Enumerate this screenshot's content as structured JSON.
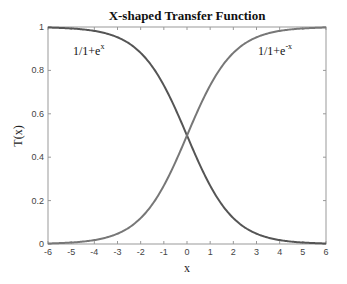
{
  "chart_data": {
    "type": "line",
    "title": "X-shaped Transfer Function",
    "xlabel": "x",
    "ylabel": "T(x)",
    "xlim": [
      -6,
      6
    ],
    "ylim": [
      0,
      1
    ],
    "x_ticks": [
      "-6",
      "-5",
      "-4",
      "-3",
      "-2",
      "-1",
      "0",
      "1",
      "2",
      "3",
      "4",
      "5",
      "6"
    ],
    "y_ticks": [
      "0",
      "0.2",
      "0.4",
      "0.6",
      "0.8",
      "1"
    ],
    "grid": false,
    "series": [
      {
        "name": "1/1+e^x",
        "formula": "1/(1+exp(x))",
        "color": "#555555",
        "x": [
          -6,
          -5,
          -4,
          -3,
          -2,
          -1,
          0,
          1,
          2,
          3,
          4,
          5,
          6
        ],
        "values": [
          0.998,
          0.993,
          0.982,
          0.953,
          0.881,
          0.731,
          0.5,
          0.269,
          0.119,
          0.047,
          0.018,
          0.007,
          0.002
        ]
      },
      {
        "name": "1/1+e^-x",
        "formula": "1/(1+exp(-x))",
        "color": "#777777",
        "x": [
          -6,
          -5,
          -4,
          -3,
          -2,
          -1,
          0,
          1,
          2,
          3,
          4,
          5,
          6
        ],
        "values": [
          0.002,
          0.007,
          0.018,
          0.047,
          0.119,
          0.269,
          0.5,
          0.731,
          0.881,
          0.953,
          0.982,
          0.993,
          0.998
        ]
      }
    ],
    "annotations": [
      {
        "base": "1/1+e",
        "sup": "x"
      },
      {
        "base": "1/1+e",
        "sup": "-x"
      }
    ]
  }
}
